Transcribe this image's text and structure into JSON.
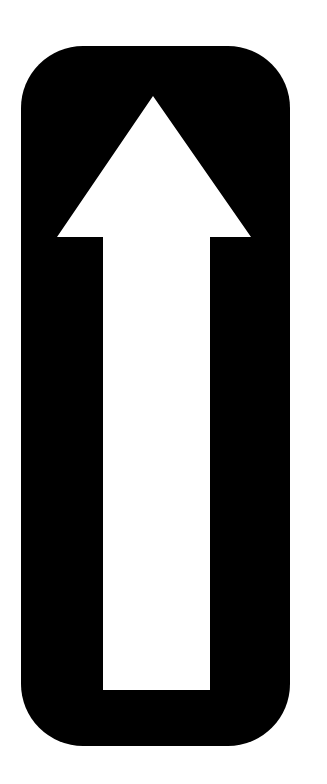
{
  "sign": {
    "icon": "up-arrow-icon",
    "background_color": "#000000",
    "arrow_color": "#ffffff",
    "page_background": "#ffffff"
  }
}
